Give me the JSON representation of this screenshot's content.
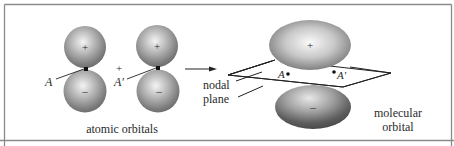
{
  "figure": {
    "labels": {
      "atom_a": "A",
      "atom_a_prime": "A′",
      "plus_between": "+",
      "lobe_positive": "+",
      "lobe_negative": "–",
      "nodal_line1": "nodal",
      "nodal_line2": "plane",
      "atomic_orbitals": "atomic orbitals",
      "molecular_line1": "molecular",
      "molecular_line2": "orbital",
      "mo_point_a": "A",
      "mo_point_a_prime": "A′"
    },
    "colors": {
      "background": "#ffffff",
      "frame": "#8a8a8a",
      "lobe_light": "#f2f2f2",
      "lobe_mid": "#a8a8a8",
      "lobe_dark": "#555555",
      "line": "#222222"
    }
  }
}
